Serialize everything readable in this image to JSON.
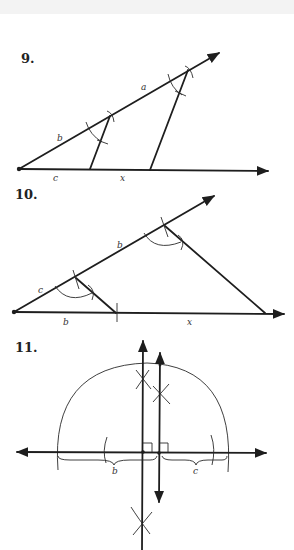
{
  "figures": [
    {
      "number": "9.",
      "labels": {
        "a": "a",
        "b": "b",
        "c": "c",
        "x": "x"
      }
    },
    {
      "number": "10.",
      "labels": {
        "c": "c",
        "b_ray": "b",
        "b_base": "b",
        "x": "x"
      }
    },
    {
      "number": "11.",
      "labels": {
        "b": "b",
        "c": "c"
      }
    }
  ],
  "colors": {
    "ink": "#1e1e1e",
    "background": "#ffffff",
    "top_band": "#f3f3f3"
  }
}
